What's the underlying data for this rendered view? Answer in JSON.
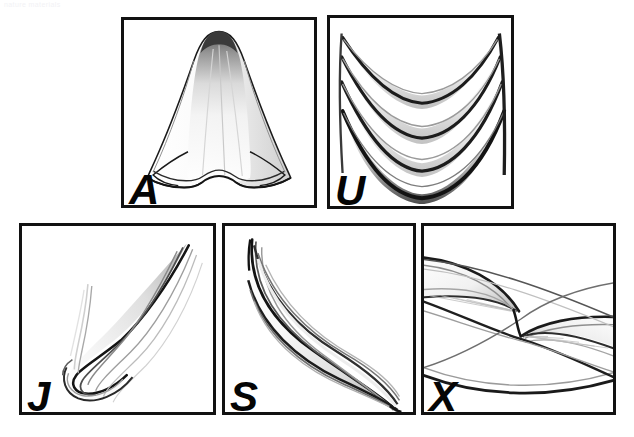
{
  "figure": {
    "watermark_text": "nature materials",
    "background_color": "#ffffff",
    "stroke_color": "#121212",
    "label_color": "#050505",
    "panel_count": 5,
    "panels": [
      {
        "id": "a",
        "label": "A",
        "shape_name": "bell-cone-drape",
        "description": "Conical bell shaped drape with tiered ruffled hem",
        "row": 1,
        "column": 1
      },
      {
        "id": "u",
        "label": "U",
        "shape_name": "nested-u-swags",
        "description": "Four nested U-shaped swag curves stacked vertically",
        "row": 1,
        "column": 2
      },
      {
        "id": "j",
        "label": "J",
        "shape_name": "j-hook-curve",
        "description": "J shaped hooked curve sweeping up to the right",
        "row": 2,
        "column": 1
      },
      {
        "id": "s",
        "label": "S",
        "shape_name": "s-curve-leaf",
        "description": "S shaped double-curved leaf form",
        "row": 2,
        "column": 2
      },
      {
        "id": "x",
        "label": "X",
        "shape_name": "crossing-x-curves",
        "description": "Two opposing curved lobes crossing to form an X",
        "row": 2,
        "column": 3
      }
    ]
  }
}
